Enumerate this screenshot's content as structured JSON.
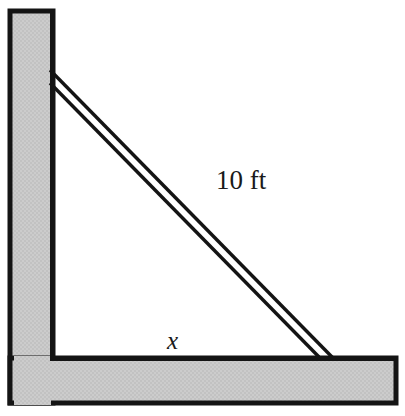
{
  "figure": {
    "type": "geometry-diagram",
    "labels": {
      "hypotenuse": "10 ft",
      "base": "x"
    },
    "colors": {
      "structure_fill": "#c9c9c9",
      "outline": "#141414",
      "ladder": "#141414",
      "background": "#ffffff",
      "text": "#1a1a1a"
    },
    "geometry": {
      "wall": {
        "x": 10,
        "y": 11,
        "width": 43,
        "height": 392
      },
      "floor": {
        "x": 10,
        "y": 358,
        "width": 386,
        "height": 45
      },
      "ladder": {
        "top_x": 50,
        "top_y": 70,
        "bottom_x": 333,
        "bottom_y": 358,
        "rail_offset": 13
      },
      "label_hyp_pos": {
        "x": 216,
        "y": 189
      },
      "label_base_pos": {
        "x": 167,
        "y": 349
      }
    }
  }
}
